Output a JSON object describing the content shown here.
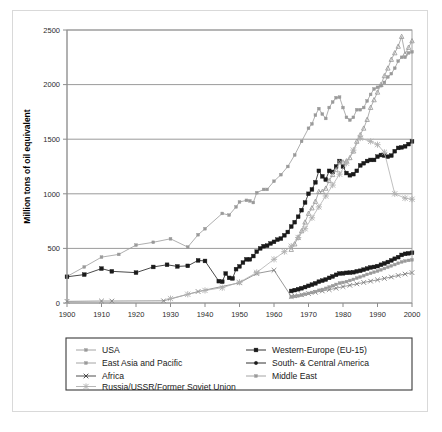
{
  "figure": {
    "background": "#ffffff",
    "frame_color": "#d9d9d9"
  },
  "chart_data": {
    "type": "line",
    "title": "",
    "xlabel": "",
    "ylabel": "Million tons of oil equivalent",
    "xlim": [
      1900,
      2000
    ],
    "ylim": [
      0,
      2500
    ],
    "xticks": [
      1900,
      1910,
      1920,
      1930,
      1940,
      1950,
      1960,
      1970,
      1980,
      1990,
      2000
    ],
    "yticks": [
      0,
      500,
      1000,
      1500,
      2000,
      2500
    ],
    "grid": "horizontal",
    "legend_position": "below-axes",
    "series": [
      {
        "name": "USA",
        "color": "#9a9a9a",
        "marker": "square-small",
        "x": [
          1900,
          1905,
          1910,
          1915,
          1920,
          1925,
          1930,
          1935,
          1938,
          1940,
          1945,
          1947,
          1949,
          1950,
          1952,
          1953,
          1954,
          1955,
          1957,
          1958,
          1960,
          1962,
          1964,
          1966,
          1968,
          1970,
          1971,
          1972,
          1973,
          1974,
          1975,
          1976,
          1977,
          1978,
          1979,
          1980,
          1981,
          1982,
          1983,
          1984,
          1985,
          1986,
          1987,
          1988,
          1989,
          1990,
          1991,
          1992,
          1993,
          1994,
          1995,
          1996,
          1997,
          1998,
          1999,
          2000
        ],
        "values": [
          243,
          330,
          420,
          445,
          530,
          556,
          588,
          512,
          625,
          680,
          820,
          805,
          880,
          925,
          940,
          935,
          920,
          1010,
          1040,
          1040,
          1115,
          1175,
          1250,
          1355,
          1480,
          1600,
          1640,
          1720,
          1780,
          1730,
          1690,
          1790,
          1840,
          1880,
          1885,
          1790,
          1700,
          1675,
          1700,
          1770,
          1770,
          1790,
          1850,
          1910,
          1960,
          1975,
          1990,
          2020,
          2070,
          2100,
          2150,
          2215,
          2250,
          2250,
          2290,
          2300
        ]
      },
      {
        "name": "Western-Europe (EU-15)",
        "color": "#1a1a1a",
        "marker": "square",
        "x": [
          1900,
          1905,
          1910,
          1913,
          1920,
          1925,
          1929,
          1932,
          1935,
          1938,
          1940,
          1944,
          1945,
          1946,
          1947,
          1948,
          1949,
          1950,
          1951,
          1952,
          1953,
          1954,
          1955,
          1956,
          1957,
          1958,
          1959,
          1960,
          1961,
          1962,
          1963,
          1964,
          1965,
          1966,
          1967,
          1968,
          1969,
          1970,
          1971,
          1972,
          1973,
          1974,
          1975,
          1976,
          1977,
          1978,
          1979,
          1980,
          1981,
          1982,
          1983,
          1984,
          1985,
          1986,
          1987,
          1988,
          1989,
          1990,
          1991,
          1992,
          1993,
          1994,
          1995,
          1996,
          1997,
          1998,
          1999,
          2000
        ],
        "values": [
          240,
          260,
          315,
          290,
          278,
          330,
          350,
          335,
          340,
          390,
          385,
          200,
          195,
          270,
          230,
          225,
          310,
          335,
          370,
          400,
          400,
          430,
          470,
          500,
          520,
          525,
          545,
          560,
          580,
          590,
          620,
          650,
          700,
          740,
          790,
          850,
          920,
          1000,
          1040,
          1105,
          1210,
          1160,
          1130,
          1210,
          1200,
          1250,
          1300,
          1250,
          1190,
          1170,
          1180,
          1210,
          1260,
          1280,
          1300,
          1310,
          1310,
          1340,
          1355,
          1350,
          1340,
          1350,
          1390,
          1420,
          1425,
          1435,
          1455,
          1480
        ]
      },
      {
        "name": "East Asia and Pacific",
        "color": "#9a9a9a",
        "marker": "triangle",
        "x": [
          1965,
          1966,
          1967,
          1968,
          1969,
          1970,
          1971,
          1972,
          1973,
          1974,
          1975,
          1976,
          1977,
          1978,
          1979,
          1980,
          1981,
          1982,
          1983,
          1984,
          1985,
          1986,
          1987,
          1988,
          1989,
          1990,
          1991,
          1992,
          1993,
          1994,
          1995,
          1996,
          1997,
          1998,
          1999,
          2000
        ],
        "values": [
          490,
          540,
          600,
          660,
          740,
          820,
          870,
          930,
          1020,
          1020,
          1050,
          1120,
          1175,
          1220,
          1290,
          1290,
          1300,
          1330,
          1390,
          1480,
          1540,
          1600,
          1680,
          1790,
          1860,
          1930,
          2000,
          2080,
          2150,
          2230,
          2290,
          2350,
          2440,
          2280,
          2340,
          2400
        ]
      },
      {
        "name": "South- & Central America",
        "color": "#1a1a1a",
        "marker": "square",
        "x": [
          1965,
          1966,
          1967,
          1968,
          1969,
          1970,
          1971,
          1972,
          1973,
          1974,
          1975,
          1976,
          1977,
          1978,
          1979,
          1980,
          1981,
          1982,
          1983,
          1984,
          1985,
          1986,
          1987,
          1988,
          1989,
          1990,
          1991,
          1992,
          1993,
          1994,
          1995,
          1996,
          1997,
          1998,
          1999,
          2000
        ],
        "values": [
          110,
          118,
          126,
          135,
          146,
          157,
          168,
          180,
          195,
          205,
          215,
          230,
          243,
          258,
          270,
          272,
          276,
          278,
          282,
          290,
          295,
          305,
          315,
          325,
          330,
          338,
          350,
          362,
          375,
          390,
          405,
          420,
          440,
          450,
          455,
          460
        ]
      },
      {
        "name": "Africa",
        "color": "#7d7d7d",
        "marker": "x",
        "x": [
          1900,
          1910,
          1913,
          1928,
          1938,
          1950,
          1955,
          1960,
          1965,
          1966,
          1968,
          1970,
          1972,
          1974,
          1976,
          1978,
          1980,
          1982,
          1984,
          1986,
          1988,
          1990,
          1992,
          1994,
          1996,
          1998,
          2000
        ],
        "values": [
          15,
          18,
          18,
          20,
          105,
          185,
          270,
          300,
          60,
          66,
          75,
          86,
          98,
          110,
          122,
          135,
          150,
          162,
          175,
          188,
          200,
          212,
          225,
          238,
          252,
          265,
          278
        ]
      },
      {
        "name": "Middle East",
        "color": "#9a9a9a",
        "marker": "square-small",
        "x": [
          1965,
          1966,
          1967,
          1968,
          1969,
          1970,
          1971,
          1972,
          1973,
          1974,
          1975,
          1976,
          1977,
          1978,
          1979,
          1980,
          1981,
          1982,
          1983,
          1984,
          1985,
          1986,
          1987,
          1988,
          1989,
          1990,
          1991,
          1992,
          1993,
          1994,
          1995,
          1996,
          1997,
          1998,
          1999,
          2000
        ],
        "values": [
          55,
          60,
          66,
          72,
          80,
          88,
          96,
          105,
          116,
          124,
          134,
          146,
          158,
          170,
          182,
          188,
          196,
          206,
          216,
          228,
          238,
          250,
          262,
          272,
          282,
          292,
          304,
          316,
          328,
          340,
          352,
          364,
          376,
          384,
          390,
          395
        ]
      },
      {
        "name": "Russia/USSR/Former Soviet Union",
        "color": "#b0b0b0",
        "marker": "star",
        "x": [
          1930,
          1935,
          1940,
          1945,
          1950,
          1955,
          1960,
          1963,
          1965,
          1967,
          1969,
          1971,
          1973,
          1975,
          1977,
          1979,
          1981,
          1983,
          1985,
          1988,
          1990,
          1992,
          1995,
          1998,
          2000
        ],
        "values": [
          40,
          80,
          115,
          140,
          190,
          280,
          400,
          470,
          520,
          600,
          680,
          780,
          880,
          980,
          1080,
          1180,
          1280,
          1400,
          1510,
          1480,
          1450,
          1380,
          1000,
          960,
          950
        ]
      }
    ]
  },
  "axes": {
    "y_title": "Million tons of oil equivalent",
    "y_ticks": [
      "0",
      "500",
      "1000",
      "1500",
      "2000",
      "2500"
    ],
    "x_ticks": [
      "1900",
      "1910",
      "1920",
      "1930",
      "1940",
      "1950",
      "1960",
      "1970",
      "1980",
      "1990",
      "2000"
    ]
  },
  "legend": {
    "entries": [
      {
        "label": "USA",
        "color": "#9a9a9a",
        "marker": "square-small"
      },
      {
        "label": "Western-Europe (EU-15)",
        "color": "#1a1a1a",
        "marker": "square"
      },
      {
        "label": "East Asia and Pacific",
        "color": "#9a9a9a",
        "marker": "square-small"
      },
      {
        "label": "South- & Central America",
        "color": "#1a1a1a",
        "marker": "circle"
      },
      {
        "label": "Africa",
        "color": "#3a3a3a",
        "marker": "x"
      },
      {
        "label": "Middle East",
        "color": "#9a9a9a",
        "marker": "square-small"
      },
      {
        "label": "Russia/USSR/Former Soviet Union",
        "color": "#b0b0b0",
        "marker": "star"
      }
    ]
  }
}
